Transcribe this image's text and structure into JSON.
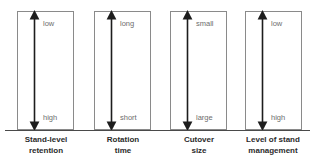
{
  "figure": {
    "type": "conceptual-gradient-diagram",
    "baseline_label": "",
    "axis_color": "#222222",
    "box_border_color": "#8a8a8a",
    "inner_label_color": "#6d6d6d",
    "caption_color": "#2b2b2b",
    "panels": [
      {
        "id": "stand-level-retention",
        "top_label": "low",
        "bottom_label": "high",
        "caption_line1": "Stand-level",
        "caption_line2": "retention",
        "caption": "Stand-level\nretention"
      },
      {
        "id": "rotation-time",
        "top_label": "long",
        "bottom_label": "short",
        "caption_line1": "Rotation",
        "caption_line2": "time",
        "caption": "Rotation\ntime"
      },
      {
        "id": "cutover-size",
        "top_label": "small",
        "bottom_label": "large",
        "caption_line1": "Cutover",
        "caption_line2": "size",
        "caption": "Cutover\nsize"
      },
      {
        "id": "level-of-stand-management",
        "top_label": "low",
        "bottom_label": "high",
        "caption_line1": "Level of stand",
        "caption_line2": "management",
        "caption": "Level of stand\nmanagement"
      }
    ]
  }
}
